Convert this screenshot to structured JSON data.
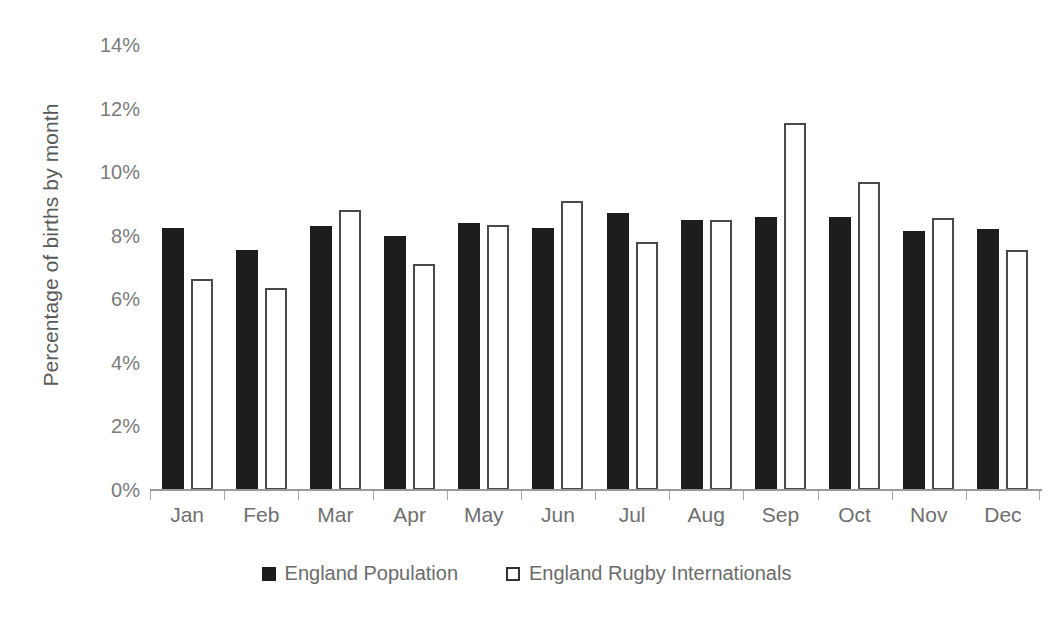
{
  "chart_data": {
    "type": "bar",
    "title": "",
    "subtitle": "",
    "xlabel": "",
    "ylabel": "Percentage of births by month",
    "ylim": [
      0,
      14
    ],
    "ytick_labels": [
      "14%",
      "12%",
      "10%",
      "8%",
      "6%",
      "4%",
      "2%",
      "0%"
    ],
    "ytick_values": [
      14,
      12,
      10,
      8,
      6,
      4,
      2,
      0
    ],
    "grid": false,
    "legend_position": "bottom",
    "value_unit": "%",
    "categories": [
      "Jan",
      "Feb",
      "Mar",
      "Apr",
      "May",
      "Jun",
      "Jul",
      "Aug",
      "Sep",
      "Oct",
      "Nov",
      "Dec"
    ],
    "series": [
      {
        "name": "England Population",
        "style": "filled",
        "color": "#1d1d1d",
        "values": [
          8.25,
          7.55,
          8.3,
          8.0,
          8.4,
          8.25,
          8.7,
          8.5,
          8.6,
          8.6,
          8.15,
          8.2
        ]
      },
      {
        "name": "England Rugby Internationals",
        "style": "outlined",
        "color": "#ffffff",
        "border_color": "#4a4a4a",
        "values": [
          6.65,
          6.35,
          8.8,
          7.1,
          8.35,
          9.1,
          7.8,
          8.5,
          11.55,
          9.7,
          8.55,
          7.55
        ]
      }
    ]
  },
  "axis": {
    "y_title": "Percentage of births by month"
  },
  "legend": {
    "items": [
      {
        "label": "England Population",
        "style": "filled"
      },
      {
        "label": "England Rugby Internationals",
        "style": "outlined"
      }
    ]
  },
  "colors": {
    "series_population": "#1d1d1d",
    "series_rugby_outline": "#4a4a4a",
    "axis_text": "#7b7b7b",
    "axis_line": "#9a9a9a",
    "background": "#ffffff"
  }
}
